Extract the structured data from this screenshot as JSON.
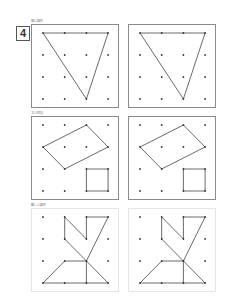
{
  "problem": {
    "number": "4"
  },
  "grid": {
    "cols": 4,
    "rows": 4,
    "dot_color": "#333333",
    "line_color": "#444444"
  },
  "sections": [
    {
      "label": "細い図形",
      "shape": "triangle",
      "segments": [
        [
          [
            0,
            0
          ],
          [
            3,
            0
          ]
        ],
        [
          [
            3,
            0
          ],
          [
            2,
            3
          ]
        ],
        [
          [
            2,
            3
          ],
          [
            0,
            0
          ]
        ]
      ]
    },
    {
      "label": "太い四角",
      "shape": "parallelogram-and-square",
      "segments": [
        [
          [
            2,
            0
          ],
          [
            3,
            1
          ]
        ],
        [
          [
            3,
            1
          ],
          [
            1,
            2
          ]
        ],
        [
          [
            1,
            2
          ],
          [
            0,
            1
          ]
        ],
        [
          [
            0,
            1
          ],
          [
            2,
            0
          ]
        ],
        [
          [
            2,
            2
          ],
          [
            3,
            2
          ]
        ],
        [
          [
            3,
            2
          ],
          [
            3,
            3
          ]
        ],
        [
          [
            3,
            3
          ],
          [
            2,
            3
          ]
        ],
        [
          [
            2,
            3
          ],
          [
            2,
            2
          ]
        ]
      ]
    },
    {
      "label": "難しい図形",
      "shape": "complex",
      "segments": [
        [
          [
            1,
            0
          ],
          [
            1,
            1
          ]
        ],
        [
          [
            1,
            0
          ],
          [
            2,
            1
          ]
        ],
        [
          [
            2,
            1
          ],
          [
            2,
            0
          ]
        ],
        [
          [
            2,
            0
          ],
          [
            3,
            0
          ]
        ],
        [
          [
            3,
            0
          ],
          [
            2,
            2
          ]
        ],
        [
          [
            1,
            1
          ],
          [
            2,
            2
          ]
        ],
        [
          [
            1,
            2
          ],
          [
            2,
            2
          ]
        ],
        [
          [
            1,
            2
          ],
          [
            0,
            3
          ]
        ],
        [
          [
            0,
            3
          ],
          [
            3,
            3
          ]
        ],
        [
          [
            2,
            2
          ],
          [
            2,
            3
          ]
        ],
        [
          [
            2,
            2
          ],
          [
            3,
            3
          ]
        ]
      ]
    }
  ]
}
